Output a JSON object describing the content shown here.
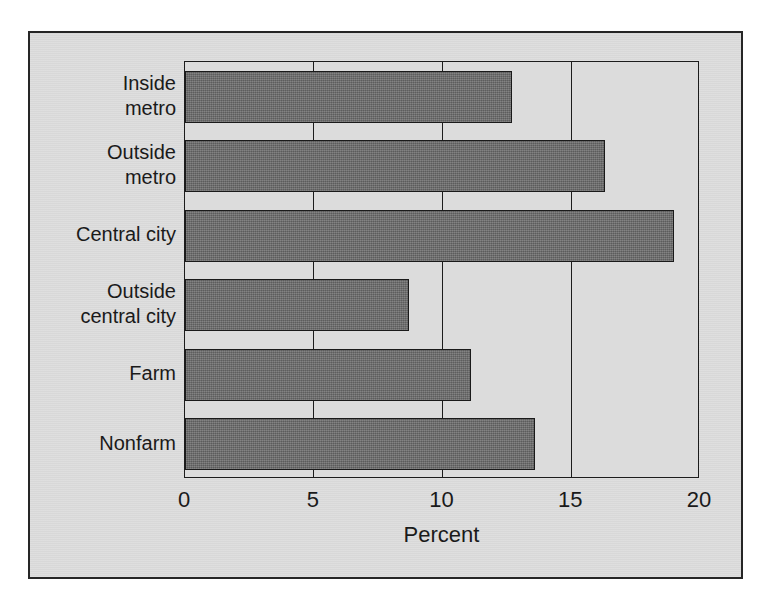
{
  "chart_data": {
    "type": "bar",
    "orientation": "horizontal",
    "title": "",
    "xlabel": "Percent",
    "ylabel": "",
    "xlim": [
      0,
      20
    ],
    "xticks": [
      0,
      5,
      10,
      15,
      20
    ],
    "xtick_labels": [
      "0",
      "5",
      "10",
      "15",
      "20"
    ],
    "grid": "vertical",
    "legend": "none",
    "categories": [
      "Inside\nmetro",
      "Outside\nmetro",
      "Central city",
      "Outside\ncentral city",
      "Farm",
      "Nonfarm"
    ],
    "values": [
      12.7,
      16.3,
      19.0,
      8.7,
      11.1,
      13.6
    ],
    "bar_color": "#6d6d6d",
    "bar_edge_color": "#1a1a1a",
    "plot_background": "#dcdcdc",
    "frame_background": "#dadada",
    "axis_color": "#1c1c1c"
  },
  "axis": {
    "x_title": "Percent",
    "tick_labels": [
      "0",
      "5",
      "10",
      "15",
      "20"
    ]
  },
  "categories": [
    {
      "label": "Inside\nmetro",
      "value": 12.7
    },
    {
      "label": "Outside\nmetro",
      "value": 16.3
    },
    {
      "label": "Central city",
      "value": 19.0
    },
    {
      "label": "Outside\ncentral city",
      "value": 8.7
    },
    {
      "label": "Farm",
      "value": 11.1
    },
    {
      "label": "Nonfarm",
      "value": 13.6
    }
  ]
}
